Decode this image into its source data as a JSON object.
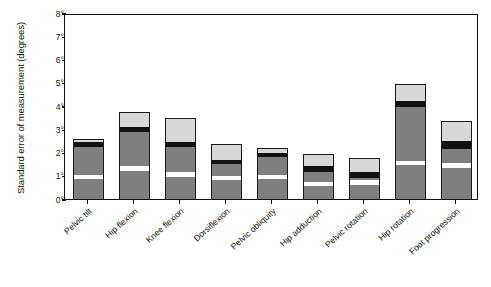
{
  "chart_data": {
    "type": "bar",
    "subtype": "stacked-bar",
    "title": "",
    "xlabel": "",
    "ylabel": "Standard error of measurement (degrees)",
    "ylim": [
      0,
      8
    ],
    "ytick_values": [
      0,
      1,
      2,
      3,
      4,
      5,
      6,
      7,
      8
    ],
    "ytick_labels": [
      "0°",
      "1°",
      "2°",
      "3°",
      "4°",
      "5°",
      "6°",
      "7°",
      "8°"
    ],
    "grid": false,
    "legend": "none",
    "categories": [
      "Pelvic tilt",
      "Hip flexion",
      "Knee flexion",
      "Dorsiflexion",
      "Pelvic obliquity",
      "Hip adduction",
      "Pelvic rotation",
      "Hip rotation",
      "Foot progression"
    ],
    "series": [
      {
        "name": "segment-1-dark",
        "color": "#7f7f7f",
        "values": [
          0.85,
          1.2,
          0.95,
          0.8,
          0.85,
          0.55,
          0.6,
          1.45,
          1.35
        ]
      },
      {
        "name": "segment-2-white",
        "color": "#ffffff",
        "values": [
          0.2,
          0.2,
          0.2,
          0.2,
          0.2,
          0.2,
          0.2,
          0.2,
          0.2
        ]
      },
      {
        "name": "segment-3-dark",
        "color": "#7f7f7f",
        "values": [
          1.2,
          1.5,
          1.1,
          0.5,
          0.75,
          0.4,
          0.1,
          2.3,
          0.6
        ]
      },
      {
        "name": "segment-4-black",
        "color": "#111111",
        "values": [
          0.2,
          0.2,
          0.2,
          0.2,
          0.2,
          0.25,
          0.25,
          0.25,
          0.35
        ]
      },
      {
        "name": "segment-5-light",
        "color": "#d8d8d8",
        "values": [
          0.15,
          0.65,
          1.05,
          0.65,
          0.2,
          0.55,
          0.6,
          0.75,
          0.85
        ]
      }
    ],
    "totals": [
      2.6,
      3.75,
      3.5,
      2.35,
      2.2,
      1.95,
      1.75,
      4.95,
      3.35
    ]
  }
}
